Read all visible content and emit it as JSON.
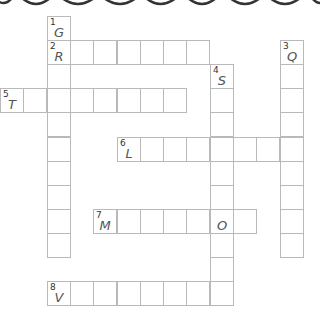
{
  "puzzle": {
    "type": "crossword",
    "cell_size": 23.3,
    "origin": {
      "x": 1,
      "y": 16
    },
    "decoration": {
      "type": "scalloped-top-border",
      "color": "#333333"
    },
    "words": [
      {
        "number": "1",
        "direction": "down",
        "row": 0,
        "col": 2,
        "length": 10,
        "letters": {
          "0": "G"
        }
      },
      {
        "number": "2",
        "direction": "across",
        "row": 1,
        "col": 2,
        "length": 7,
        "letters": {
          "0": "R"
        }
      },
      {
        "number": "3",
        "direction": "down",
        "row": 1,
        "col": 12,
        "length": 9,
        "letters": {
          "0": "Q"
        }
      },
      {
        "number": "4",
        "direction": "down",
        "row": 2,
        "col": 9,
        "length": 10,
        "letters": {
          "0": "S"
        }
      },
      {
        "number": "5",
        "direction": "across",
        "row": 3,
        "col": 0,
        "length": 8,
        "letters": {
          "0": "T"
        }
      },
      {
        "number": "6",
        "direction": "across",
        "row": 5,
        "col": 5,
        "length": 8,
        "letters": {
          "0": "L"
        }
      },
      {
        "number": "7",
        "direction": "across",
        "row": 8,
        "col": 4,
        "length": 7,
        "letters": {
          "0": "M",
          "5": "O"
        }
      },
      {
        "number": "8",
        "direction": "across",
        "row": 11,
        "col": 2,
        "length": 8,
        "letters": {
          "0": "V"
        }
      }
    ]
  }
}
